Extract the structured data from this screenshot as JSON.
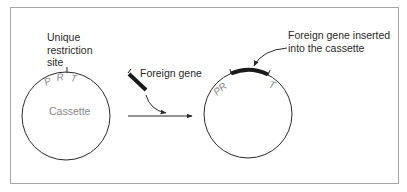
{
  "figure": {
    "left_panel": {
      "restriction_label": [
        "Unique",
        "restriction",
        "site"
      ],
      "promoter_letters": [
        "P",
        "R",
        "T"
      ],
      "plasmid_label": "Cassette"
    },
    "middle": {
      "foreign_gene_label": "Foreign gene"
    },
    "right_panel": {
      "inserted_label": [
        "Foreign gene inserted",
        "into the cassette"
      ],
      "pr_label": "PR",
      "t_label": "T"
    },
    "colors": {
      "line": "#2a2a2a",
      "frame": "#a8a8a8",
      "muted_text": "#8a8a8a",
      "gene_bar": "#1a1a1a"
    }
  }
}
